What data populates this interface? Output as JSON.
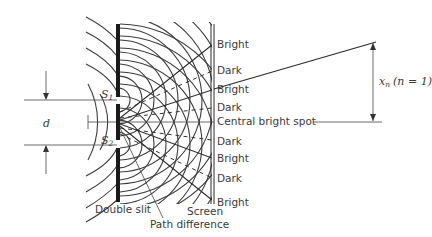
{
  "diagram": {
    "labels": {
      "slit_1": "S",
      "slit_1_sub": "1",
      "slit_2": "S",
      "slit_2_sub": "2",
      "slit_separation": "d",
      "double_slit": "Double slit",
      "path_difference": "Path difference",
      "screen": "Screen",
      "central_bright_spot": "Central bright spot",
      "fringe_distance": "x",
      "fringe_distance_sub": "n",
      "fringe_order": "(n = 1)"
    },
    "fringes": [
      {
        "label": "Bright",
        "y": 45
      },
      {
        "label": "Dark",
        "y": 71
      },
      {
        "label": "Bright",
        "y": 90
      },
      {
        "label": "Dark",
        "y": 108
      },
      {
        "label": "Bright",
        "y": 158
      },
      {
        "label": "Dark",
        "y": 178
      },
      {
        "label": "Dark",
        "y": 140
      },
      {
        "label": "Bright",
        "y": 205
      }
    ],
    "colors": {
      "ink": "#2a2a2a",
      "text": "#3a3a3a",
      "background": "#ffffff"
    }
  }
}
